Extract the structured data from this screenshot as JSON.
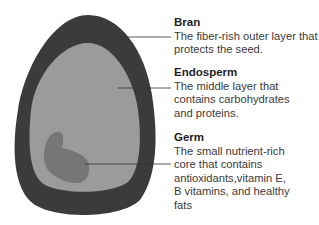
{
  "diagram": {
    "colors": {
      "bran": "#3b3b3b",
      "endosperm": "#9b9b9b",
      "germ": "#767676",
      "leader_line": "#333333"
    },
    "labels": [
      {
        "id": "bran",
        "title": "Bran",
        "description": "The fiber-rish outer layer that protects the seed."
      },
      {
        "id": "endosperm",
        "title": "Endosperm",
        "description": "The middle layer that contains carbohydrates and proteins."
      },
      {
        "id": "germ",
        "title": "Germ",
        "description": "The small nutrient-rich core that contains antioxidants,vitamin E, B vitamins, and healthy fats"
      }
    ]
  }
}
